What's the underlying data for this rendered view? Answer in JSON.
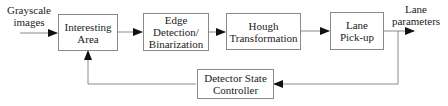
{
  "diagram": {
    "input_label_line1": "Grayscale",
    "input_label_line2": "images",
    "output_label_line1": "Lane",
    "output_label_line2": "parameters",
    "nodes": [
      {
        "id": "interesting-area",
        "line1": "Interesting",
        "line2": "Area",
        "line3": ""
      },
      {
        "id": "edge-detection",
        "line1": "Edge",
        "line2": "Detection/",
        "line3": "Binarization"
      },
      {
        "id": "hough",
        "line1": "Hough",
        "line2": "Transformation",
        "line3": ""
      },
      {
        "id": "lane-pickup",
        "line1": "Lane",
        "line2": "Pick-up",
        "line3": ""
      },
      {
        "id": "controller",
        "line1": "Detector State",
        "line2": "Controller",
        "line3": ""
      }
    ],
    "edges": [
      {
        "from": "input",
        "to": "interesting-area"
      },
      {
        "from": "interesting-area",
        "to": "edge-detection"
      },
      {
        "from": "edge-detection",
        "to": "hough"
      },
      {
        "from": "hough",
        "to": "lane-pickup"
      },
      {
        "from": "lane-pickup",
        "to": "output"
      },
      {
        "from": "lane-pickup",
        "to": "controller"
      },
      {
        "from": "controller",
        "to": "interesting-area"
      }
    ],
    "colors": {
      "line": "#8a8a8a",
      "arrow": "#111111",
      "text": "#222222"
    }
  }
}
